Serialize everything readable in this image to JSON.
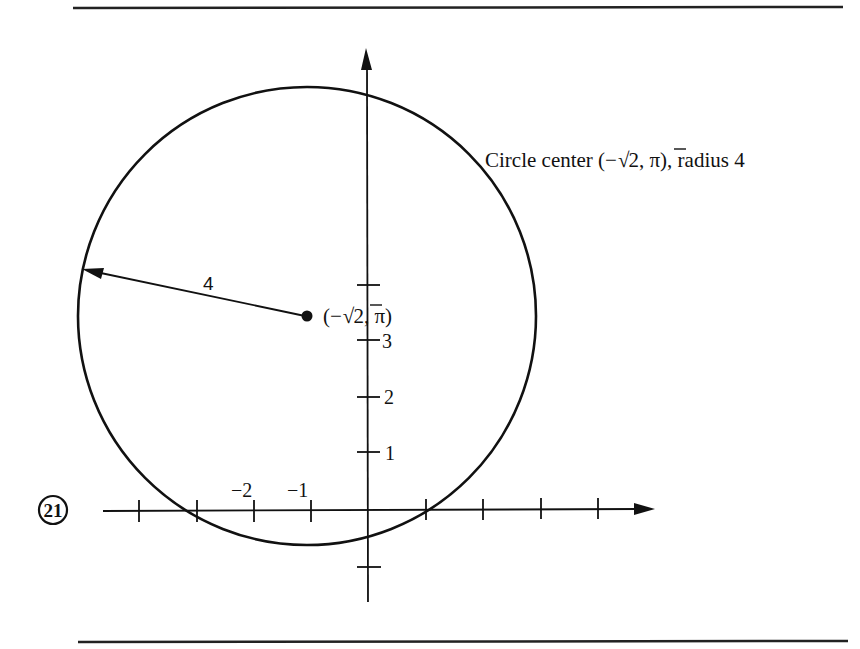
{
  "problem_number": "21",
  "annotation": {
    "description": "Circle center (−√2, π), radius 4",
    "prefix": "Circle center (−",
    "sqrt": "√",
    "radicand": "2",
    "suffix": ", π), radius 4"
  },
  "center_label": {
    "open": "(−",
    "sqrt": "√",
    "radicand": "2",
    "close": ", π)"
  },
  "radius_label": "4",
  "x_axis": {
    "tick_labels": [
      "−2",
      "−1"
    ],
    "ticks": [
      -4,
      -3,
      -2,
      -1,
      1,
      2,
      3,
      4
    ]
  },
  "y_axis": {
    "tick_labels": [
      "1",
      "2",
      "3"
    ],
    "ticks": [
      -1,
      1,
      2,
      3,
      4
    ]
  },
  "figure": {
    "circle": {
      "center": "(-sqrt(2), pi)",
      "radius": 4
    },
    "stroke_color": "#111111",
    "background": "#ffffff"
  }
}
